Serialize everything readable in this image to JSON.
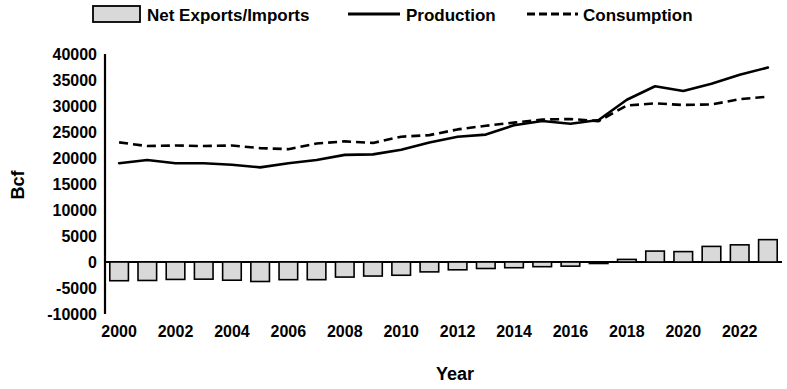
{
  "chart_data": {
    "type": "bar",
    "title": "",
    "xlabel": "Year",
    "ylabel": "Bcf",
    "ylim": [
      -10000,
      40000
    ],
    "ytick_values": [
      -10000,
      -5000,
      0,
      5000,
      10000,
      15000,
      20000,
      25000,
      30000,
      35000,
      40000
    ],
    "ytick_labels": [
      "-10000",
      "-5000",
      "0",
      "5000",
      "10000",
      "15000",
      "20000",
      "25000",
      "30000",
      "35000",
      "40000"
    ],
    "grid": false,
    "legend_position": "top",
    "categories": [
      2000,
      2001,
      2002,
      2003,
      2004,
      2005,
      2006,
      2007,
      2008,
      2009,
      2010,
      2011,
      2012,
      2013,
      2014,
      2015,
      2016,
      2017,
      2018,
      2019,
      2020,
      2021,
      2022,
      2023
    ],
    "xtick_labels": [
      "2000",
      "2002",
      "2004",
      "2006",
      "2008",
      "2010",
      "2012",
      "2014",
      "2016",
      "2018",
      "2020",
      "2022"
    ],
    "xtick_values": [
      2000,
      2002,
      2004,
      2006,
      2008,
      2010,
      2012,
      2014,
      2016,
      2018,
      2020,
      2022
    ],
    "series": [
      {
        "name": "Net Exports/Imports",
        "render": "bar",
        "color": "#d9d9d9",
        "values": [
          -3600,
          -3550,
          -3350,
          -3300,
          -3500,
          -3750,
          -3400,
          -3400,
          -2900,
          -2700,
          -2550,
          -1900,
          -1500,
          -1250,
          -1100,
          -900,
          -800,
          -100,
          500,
          2100,
          2000,
          3000,
          3300,
          4300
        ]
      },
      {
        "name": "Production",
        "render": "line-solid",
        "color": "#000000",
        "values": [
          19000,
          19600,
          19000,
          19000,
          18700,
          18200,
          19000,
          19600,
          20600,
          20700,
          21600,
          23000,
          24100,
          24500,
          26300,
          27100,
          26600,
          27300,
          31200,
          33800,
          32900,
          34300,
          36000,
          37400
        ]
      },
      {
        "name": "Consumption",
        "render": "line-dashed",
        "color": "#000000",
        "values": [
          23000,
          22300,
          22400,
          22300,
          22400,
          21900,
          21700,
          22800,
          23200,
          22900,
          24100,
          24400,
          25500,
          26200,
          26800,
          27400,
          27500,
          27100,
          30100,
          30500,
          30200,
          30300,
          31300,
          31800
        ]
      }
    ],
    "legend": [
      {
        "label": "Net Exports/Imports",
        "marker": "bar-swatch"
      },
      {
        "label": "Production",
        "marker": "solid-line"
      },
      {
        "label": "Consumption",
        "marker": "dashed-line"
      }
    ]
  }
}
